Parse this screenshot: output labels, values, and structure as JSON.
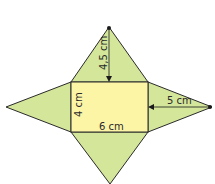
{
  "diagram": {
    "base": {
      "width_label": "6 cm",
      "height_label": "4 cm",
      "fill": "#fdf5a6"
    },
    "faces_fill": "#d4e69a",
    "stroke": "#2a2a2a",
    "labels": {
      "top_height": "4,5 cm",
      "right_height": "5 cm",
      "base_width": "6 cm",
      "base_height": "4 cm"
    }
  }
}
